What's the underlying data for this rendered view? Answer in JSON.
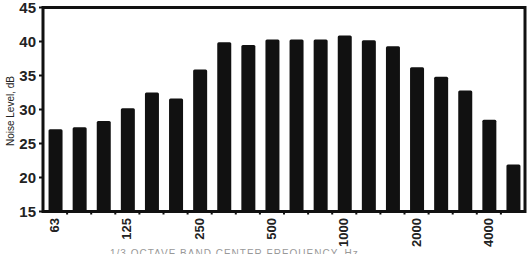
{
  "chart_data": {
    "type": "bar",
    "title": "",
    "xlabel": "",
    "ylabel": "Noise Level, dB",
    "ylim": [
      15,
      45
    ],
    "yticks": [
      15,
      20,
      25,
      30,
      35,
      40,
      45
    ],
    "grid": false,
    "legend": null,
    "categories": [
      "63",
      "80",
      "100",
      "125",
      "160",
      "200",
      "250",
      "315",
      "400",
      "500",
      "630",
      "800",
      "1000",
      "1250",
      "1600",
      "2000",
      "2500",
      "3150",
      "4000",
      "5000"
    ],
    "xtick_labels_shown": [
      {
        "label": "63",
        "index": 0
      },
      {
        "label": "125",
        "index": 3
      },
      {
        "label": "250",
        "index": 6
      },
      {
        "label": "500",
        "index": 9
      },
      {
        "label": "1000",
        "index": 12
      },
      {
        "label": "2000",
        "index": 15
      },
      {
        "label": "4000",
        "index": 18
      }
    ],
    "values": [
      27.1,
      27.4,
      28.3,
      30.2,
      32.5,
      31.6,
      35.9,
      39.9,
      39.5,
      40.3,
      40.3,
      40.3,
      40.9,
      40.2,
      39.3,
      36.2,
      34.8,
      32.8,
      28.5,
      21.9
    ],
    "bar_color": "#111111"
  },
  "labels": {
    "ylabel": "Noise Level, dB",
    "footer_truncated": "1/3 OCTAVE BAND CENTER FREQUENCY, Hz"
  }
}
